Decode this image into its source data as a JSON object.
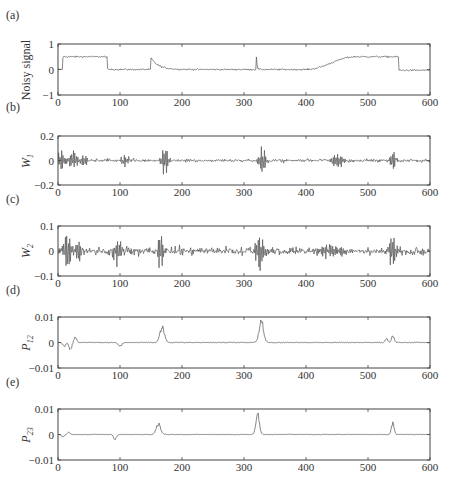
{
  "figure": {
    "panel_labels": [
      "(a)",
      "(b)",
      "(c)",
      "(d)",
      "(e)"
    ]
  },
  "chart_data": [
    {
      "type": "line",
      "panel": "(a)",
      "title": "",
      "xlabel": "",
      "ylabel": "Noisy signal",
      "xlim": [
        0,
        600
      ],
      "ylim": [
        -1,
        1
      ],
      "xticks": [
        0,
        100,
        200,
        300,
        400,
        500,
        600
      ],
      "yticks": [
        -1,
        0,
        1
      ],
      "ytick_labels": [
        "−1",
        "0",
        "1"
      ],
      "grid": false,
      "description": "Piecewise signal with additive noise: step to 0.5 at ~10, drop to 0 at ~80, spike at ~150 decaying, spike at ~320, smooth ramp 0→0.5 between ~400 and ~480, plateau to ~550, drop to 0.",
      "segments": [
        {
          "x0": 0,
          "x1": 8,
          "y": 0.0
        },
        {
          "x0": 8,
          "x1": 80,
          "y": 0.5
        },
        {
          "x0": 80,
          "x1": 400,
          "y": 0.0
        },
        {
          "x0": 400,
          "x1": 480,
          "ramp_to": 0.5
        },
        {
          "x0": 480,
          "x1": 550,
          "y": 0.5
        },
        {
          "x0": 550,
          "x1": 600,
          "y": -0.03
        }
      ],
      "spikes": [
        {
          "x": 150,
          "height": 0.45,
          "decay": 12
        },
        {
          "x": 320,
          "height": 0.5,
          "decay": 1
        }
      ],
      "noise": 0.03
    },
    {
      "type": "line",
      "panel": "(b)",
      "ylabel": "W_1",
      "ylabel_main": "W",
      "ylabel_sub": "1",
      "xlim": [
        0,
        600
      ],
      "ylim": [
        -0.2,
        0.2
      ],
      "xticks": [
        0,
        100,
        200,
        300,
        400,
        500,
        600
      ],
      "yticks": [
        -0.2,
        0,
        0.2
      ],
      "ytick_labels": [
        "−0.2",
        "0",
        "0.2"
      ],
      "grid": false,
      "description": "Level-1 wavelet detail coefficients; oscillatory bursts at ~0-45, ~105, ~172, ~330, ~440-460, ~540.",
      "bursts": [
        {
          "x": 5,
          "amp": 0.1,
          "width": 6
        },
        {
          "x": 25,
          "amp": 0.1,
          "width": 7
        },
        {
          "x": 42,
          "amp": 0.06,
          "width": 6
        },
        {
          "x": 107,
          "amp": 0.06,
          "width": 6
        },
        {
          "x": 172,
          "amp": 0.14,
          "width": 6
        },
        {
          "x": 330,
          "amp": 0.13,
          "width": 6
        },
        {
          "x": 450,
          "amp": 0.05,
          "width": 12
        },
        {
          "x": 540,
          "amp": 0.09,
          "width": 6
        }
      ],
      "noise": 0.012
    },
    {
      "type": "line",
      "panel": "(c)",
      "ylabel": "W_2",
      "ylabel_main": "W",
      "ylabel_sub": "2",
      "xlim": [
        0,
        600
      ],
      "ylim": [
        -0.1,
        0.1
      ],
      "xticks": [
        0,
        100,
        200,
        300,
        400,
        500,
        600
      ],
      "yticks": [
        -0.1,
        0,
        0.1
      ],
      "ytick_labels": [
        "−0.1",
        "0",
        "0.1"
      ],
      "grid": false,
      "description": "Level-2 wavelet detail coefficients; large bursts at ~15-35, ~95, ~165, ~325, ~540.",
      "bursts": [
        {
          "x": 15,
          "amp": 0.08,
          "width": 7
        },
        {
          "x": 33,
          "amp": 0.07,
          "width": 5
        },
        {
          "x": 97,
          "amp": 0.055,
          "width": 7
        },
        {
          "x": 165,
          "amp": 0.095,
          "width": 5
        },
        {
          "x": 325,
          "amp": 0.095,
          "width": 7
        },
        {
          "x": 440,
          "amp": 0.03,
          "width": 20
        },
        {
          "x": 540,
          "amp": 0.075,
          "width": 7
        }
      ],
      "noise": 0.014
    },
    {
      "type": "line",
      "panel": "(d)",
      "ylabel": "P_12",
      "ylabel_main": "P",
      "ylabel_sub": "12",
      "xlim": [
        0,
        600
      ],
      "ylim": [
        -0.01,
        0.01
      ],
      "xticks": [
        0,
        100,
        200,
        300,
        400,
        500,
        600
      ],
      "yticks": [
        -0.01,
        0,
        0.01
      ],
      "ytick_labels": [
        "−0.01",
        "0",
        "0.01"
      ],
      "grid": false,
      "description": "Cross-scale product of W1 and W2; positive peaks at ~168 (~0.006) and ~328 (~0.008), small peaks ~530-540, dip near ~100 and oscillation 0-45.",
      "peaks": [
        {
          "x": 20,
          "height": -0.003,
          "width": 3
        },
        {
          "x": 28,
          "height": 0.002,
          "width": 3
        },
        {
          "x": 10,
          "height": -0.0015,
          "width": 3
        },
        {
          "x": 100,
          "height": -0.0015,
          "width": 4
        },
        {
          "x": 168,
          "height": 0.006,
          "width": 5
        },
        {
          "x": 328,
          "height": 0.008,
          "width": 5
        },
        {
          "x": 530,
          "height": 0.0015,
          "width": 3
        },
        {
          "x": 540,
          "height": 0.0025,
          "width": 3
        }
      ],
      "noise": 0.00015
    },
    {
      "type": "line",
      "panel": "(e)",
      "ylabel": "P_23",
      "ylabel_main": "P",
      "ylabel_sub": "23",
      "xlim": [
        0,
        600
      ],
      "ylim": [
        -0.01,
        0.01
      ],
      "xticks": [
        0,
        100,
        200,
        300,
        400,
        500,
        600
      ],
      "yticks": [
        -0.01,
        0,
        0.01
      ],
      "ytick_labels": [
        "−0.01",
        "0",
        "0.01"
      ],
      "grid": false,
      "description": "Cross-scale product of W2 and W3; peaks at ~162 (~0.004), ~322 (~0.008), ~540 (~0.004), dip near ~92.",
      "peaks": [
        {
          "x": 8,
          "height": -0.001,
          "width": 3
        },
        {
          "x": 17,
          "height": 0.0008,
          "width": 3
        },
        {
          "x": 92,
          "height": -0.002,
          "width": 3
        },
        {
          "x": 162,
          "height": 0.004,
          "width": 5
        },
        {
          "x": 322,
          "height": 0.0075,
          "width": 4
        },
        {
          "x": 540,
          "height": 0.0045,
          "width": 3
        }
      ],
      "noise": 0.00012
    }
  ]
}
